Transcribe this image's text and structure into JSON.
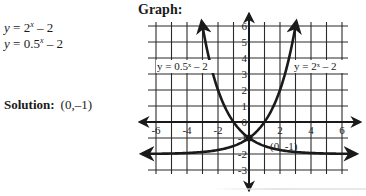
{
  "problem": {
    "equations": [
      {
        "lhs": "y",
        "base": "2",
        "exp": "x",
        "tail": " – 2"
      },
      {
        "lhs": "y",
        "base": "0.5",
        "exp": "x",
        "tail": " – 2"
      }
    ],
    "solution_label": "Solution:",
    "solution_value": "(0,–1)"
  },
  "graph": {
    "title": "Graph:",
    "curve_labels": {
      "left": "y = 0.5ˣ – 2",
      "right": "y = 2ˣ – 2"
    },
    "point_label": "(0, -1)",
    "x_tick_labels": [
      "-6",
      "-4",
      "-2",
      "2",
      "4",
      "6"
    ],
    "y_tick_labels": [
      "6",
      "5",
      "4",
      "3",
      "2",
      "1",
      "0",
      "-1",
      "-2",
      "-3"
    ],
    "colors": {
      "ink": "#1a1a1a",
      "grid": "#2b2b2b"
    }
  },
  "chart_data": {
    "type": "line",
    "title": "Graph:",
    "xlabel": "",
    "ylabel": "",
    "xlim": [
      -6.5,
      6.5
    ],
    "ylim": [
      -3,
      6
    ],
    "grid": true,
    "series": [
      {
        "name": "y = 2^x - 2",
        "x": [
          -6,
          -4,
          -2,
          -1,
          0,
          1,
          2,
          2.5,
          3
        ],
        "values": [
          -1.98,
          -1.94,
          -1.75,
          -1.5,
          -1,
          0,
          2,
          3.66,
          6
        ]
      },
      {
        "name": "y = 0.5^x - 2",
        "x": [
          -3,
          -2.5,
          -2,
          -1,
          0,
          1,
          2,
          4,
          6
        ],
        "values": [
          6,
          3.66,
          2,
          0,
          -1,
          -1.5,
          -1.75,
          -1.94,
          -1.98
        ]
      }
    ],
    "annotations": [
      {
        "text": "(0, -1)",
        "x": 0,
        "y": -1,
        "type": "intersection"
      }
    ],
    "tick_labels_x": [
      -6,
      -4,
      -2,
      2,
      4,
      6
    ],
    "tick_labels_y": [
      -3,
      -2,
      -1,
      0,
      1,
      2,
      3,
      4,
      5,
      6
    ]
  }
}
